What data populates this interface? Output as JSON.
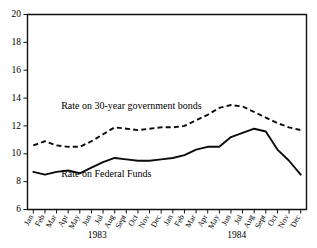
{
  "chart_data": {
    "type": "line",
    "title": "",
    "xlabel": "",
    "ylabel": "",
    "ylim": [
      6,
      20
    ],
    "yticks": [
      6,
      8,
      10,
      12,
      14,
      16,
      18,
      20
    ],
    "ytick_labels": [
      "6",
      "8",
      "10",
      "12",
      "14",
      "16",
      "18",
      "20"
    ],
    "grid": false,
    "legend_position": "inline-annotations",
    "categories": [
      "Jan",
      "Feb",
      "Mar",
      "Apr",
      "May",
      "Jun",
      "Jul",
      "Aug",
      "Sept",
      "Oct",
      "Nov",
      "Dec",
      "Jan",
      "Feb",
      "Mar",
      "Apr",
      "May",
      "Jun",
      "Jul",
      "Aug",
      "Sept",
      "Oct",
      "Nov",
      "Dec"
    ],
    "group_labels": [
      {
        "label": "1983",
        "start_index": 0,
        "end_index": 11
      },
      {
        "label": "1984",
        "start_index": 12,
        "end_index": 23
      }
    ],
    "series": [
      {
        "name": "Rate on 30-year government bonds",
        "style": "dashed",
        "values": [
          10.6,
          10.9,
          10.6,
          10.5,
          10.5,
          10.9,
          11.4,
          11.9,
          11.8,
          11.7,
          11.8,
          11.9,
          11.9,
          12.0,
          12.4,
          12.8,
          13.3,
          13.5,
          13.4,
          13.0,
          12.6,
          12.2,
          11.9,
          11.7
        ]
      },
      {
        "name": "Rate on Federal Funds",
        "style": "solid",
        "values": [
          8.7,
          8.5,
          8.7,
          8.8,
          8.6,
          9.0,
          9.4,
          9.7,
          9.6,
          9.5,
          9.5,
          9.6,
          9.7,
          9.9,
          10.3,
          10.5,
          10.5,
          11.2,
          11.5,
          11.8,
          11.6,
          10.3,
          9.5,
          8.5
        ]
      }
    ],
    "annotations": [
      {
        "text": "Rate on 30-year government bonds",
        "series": "Rate on 30-year government bonds",
        "x_index": 2.4,
        "y_value": 13.2
      },
      {
        "text": "Rate on Federal Funds",
        "series": "Rate on Federal Funds",
        "x_index": 2.4,
        "y_value": 8.3
      }
    ]
  }
}
